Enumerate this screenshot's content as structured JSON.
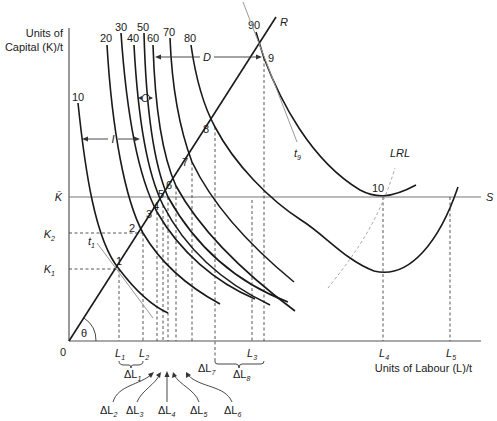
{
  "figure": {
    "y_axis_label_line1": "Units of",
    "y_axis_label_line2": "Capital (K)/t",
    "x_axis_label": "Units of Labour (L)/t",
    "origin_label": "0",
    "angle_label": "θ",
    "ray_label": "R",
    "capital_limit_label": "K̄",
    "capital_limit_line_label": "S",
    "lrl_label": "LRL",
    "k_ticks": [
      {
        "label": "K",
        "sub": "1"
      },
      {
        "label": "K",
        "sub": "2"
      }
    ],
    "l_ticks": [
      {
        "label": "L",
        "sub": "1"
      },
      {
        "label": "L",
        "sub": "2"
      },
      {
        "label": "L",
        "sub": "3"
      },
      {
        "label": "L",
        "sub": "4"
      },
      {
        "label": "L",
        "sub": "5"
      }
    ],
    "isoquant_labels": [
      "10",
      "20",
      "30",
      "40",
      "50",
      "60",
      "70",
      "80",
      "90"
    ],
    "point_labels": [
      "1",
      "2",
      "3",
      "4",
      "5",
      "6",
      "7",
      "8",
      "9",
      "10"
    ],
    "tangent_labels": [
      {
        "label": "t",
        "sub": "1"
      },
      {
        "label": "t",
        "sub": "9"
      }
    ],
    "region_labels": {
      "I": "I",
      "C": "C",
      "D": "D"
    },
    "delta_labels": [
      {
        "label": "ΔL",
        "sub": "1"
      },
      {
        "label": "ΔL",
        "sub": "2"
      },
      {
        "label": "ΔL",
        "sub": "3"
      },
      {
        "label": "ΔL",
        "sub": "4"
      },
      {
        "label": "ΔL",
        "sub": "5"
      },
      {
        "label": "ΔL",
        "sub": "6"
      },
      {
        "label": "ΔL",
        "sub": "7"
      },
      {
        "label": "ΔL",
        "sub": "8"
      }
    ]
  }
}
